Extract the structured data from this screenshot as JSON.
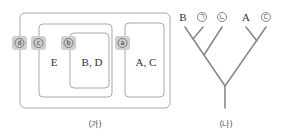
{
  "diagram_ga": {
    "caption": "(가)",
    "boxes": [
      {
        "id": "d",
        "tag": "d",
        "content": ""
      },
      {
        "id": "c",
        "tag": "c",
        "content": "E"
      },
      {
        "id": "b",
        "tag": "b",
        "content": "B, D"
      },
      {
        "id": "a",
        "tag": "a",
        "content": "A, C"
      }
    ]
  },
  "diagram_na": {
    "caption": "(나)",
    "leaves": [
      {
        "label": "B",
        "circled": false
      },
      {
        "label": "ㄱ",
        "circled": true
      },
      {
        "label": "ㄴ",
        "circled": true
      },
      {
        "label": "A",
        "circled": false
      },
      {
        "label": "ㄷ",
        "circled": true
      }
    ]
  }
}
